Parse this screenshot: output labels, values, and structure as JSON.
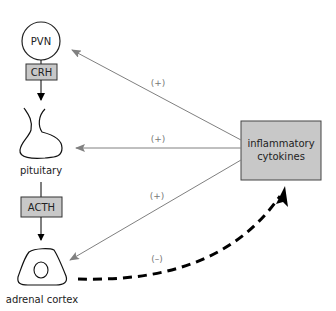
{
  "diagram": {
    "type": "HPA axis feedback",
    "nodes": {
      "pvn": {
        "label": "PVN"
      },
      "crh": {
        "label": "CRH"
      },
      "pituitary": {
        "label": "pituitary"
      },
      "acth": {
        "label": "ACTH"
      },
      "adrenal": {
        "label": "adrenal cortex"
      },
      "cytokines": {
        "line1": "inflammatory",
        "line2": "cytokines"
      }
    },
    "edges": {
      "to_pvn": {
        "sign": "(+)"
      },
      "to_pituitary": {
        "sign": "(+)"
      },
      "to_adrenal": {
        "sign": "(+)"
      },
      "adrenal_to_cytokines": {
        "sign": "(–)"
      }
    },
    "colors": {
      "box_fill": "#c8c8c8",
      "gray_arrow": "#808080",
      "black": "#000000"
    }
  }
}
